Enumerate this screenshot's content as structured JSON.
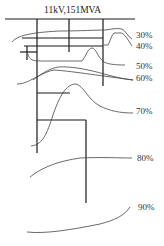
{
  "diagram": {
    "title": "11kV,151MVA",
    "contour_labels": [
      {
        "text": "30%",
        "x": 136,
        "y": 38
      },
      {
        "text": "40%",
        "x": 136,
        "y": 49
      },
      {
        "text": "50%",
        "x": 136,
        "y": 69
      },
      {
        "text": "60%",
        "x": 136,
        "y": 81
      },
      {
        "text": "70%",
        "x": 136,
        "y": 114
      },
      {
        "text": "80%",
        "x": 137,
        "y": 161
      },
      {
        "text": "90%",
        "x": 138,
        "y": 210
      }
    ],
    "colors": {
      "wire": "#1a1a1a",
      "curve": "#444444",
      "background": "#ffffff"
    }
  }
}
